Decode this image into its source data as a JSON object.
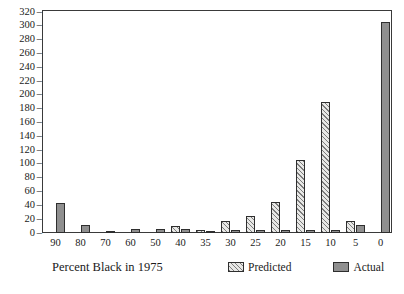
{
  "chart_data": {
    "type": "bar",
    "title": "",
    "xlabel": "Percent Black in 1975",
    "ylabel": "",
    "categories": [
      "90",
      "80",
      "70",
      "60",
      "50",
      "40",
      "35",
      "30",
      "25",
      "20",
      "15",
      "10",
      "5",
      "0"
    ],
    "series": [
      {
        "name": "Predicted",
        "values": [
          0,
          0,
          0,
          0,
          0,
          10,
          5,
          17,
          25,
          45,
          105,
          190,
          17,
          0
        ]
      },
      {
        "name": "Actual",
        "values": [
          43,
          12,
          3,
          6,
          6,
          6,
          3,
          4,
          5,
          5,
          5,
          5,
          12,
          305
        ]
      }
    ],
    "ylim": [
      0,
      320
    ],
    "yticks": [
      0,
      20,
      40,
      60,
      80,
      100,
      120,
      140,
      160,
      180,
      200,
      220,
      240,
      260,
      280,
      300,
      320
    ],
    "ytick_labels": [
      "0",
      "20",
      "40",
      "60",
      "80",
      "100",
      "120",
      "140",
      "160",
      "180",
      "200",
      "220",
      "240",
      "260",
      "280",
      "300",
      "320"
    ],
    "grid": false,
    "legend_position": "bottom-right",
    "colors": {
      "predicted": "#e8e8e6",
      "predicted_hatch": "#7d7d7d",
      "actual": "#8f8f8f",
      "outline": "#2e2e2e",
      "frame": "#3a3a3a"
    }
  },
  "axis": {
    "tick_dash": "–"
  },
  "legend": {
    "items": [
      {
        "label": "Predicted",
        "style": "hatched"
      },
      {
        "label": "Actual",
        "style": "solid"
      }
    ]
  }
}
